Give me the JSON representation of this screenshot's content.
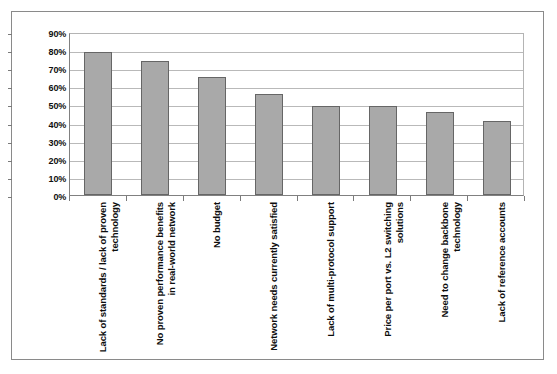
{
  "chart_data": {
    "type": "bar",
    "title": "",
    "subtitle": "",
    "xlabel": "",
    "ylabel": "",
    "ylim": [
      0,
      90
    ],
    "ytick_labels": [
      "90%",
      "80%",
      "70%",
      "60%",
      "50%",
      "40%",
      "30%",
      "20%",
      "10%",
      "0%"
    ],
    "ytick_values": [
      90,
      80,
      70,
      60,
      50,
      40,
      30,
      20,
      10,
      0
    ],
    "grid": true,
    "legend": "none",
    "orientation": "vertical",
    "bar_color": "#a9a9a9",
    "bar_border_color": "#666666",
    "categories": [
      "Lack of standards / lack of proven technology",
      "No proven performance benefits in real-world network",
      "No budget",
      "Network needs currently satisfied",
      "Lack of multi-protocol support",
      "Price per port vs. L2 switching solutions",
      "Need to change backbone technology",
      "Lack of reference accounts"
    ],
    "values": [
      79,
      74,
      65,
      56,
      49,
      49,
      46,
      41
    ],
    "value_unit": "%"
  }
}
